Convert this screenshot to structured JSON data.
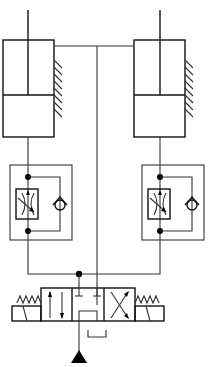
{
  "diagram": {
    "type": "hydraulic-schematic",
    "colors": {
      "line": "#111111",
      "background": "#ffffff"
    },
    "components": [
      {
        "id": "cylinder-left",
        "kind": "double-acting-cylinder"
      },
      {
        "id": "cylinder-right",
        "kind": "double-acting-cylinder"
      },
      {
        "id": "flow-control-left",
        "kind": "one-way-flow-control-valve",
        "parts": [
          "adjustable-throttle",
          "check-valve"
        ]
      },
      {
        "id": "flow-control-right",
        "kind": "one-way-flow-control-valve",
        "parts": [
          "adjustable-throttle",
          "check-valve"
        ]
      },
      {
        "id": "directional-valve",
        "kind": "4/3-directional-valve",
        "actuation": [
          "solenoid-left",
          "solenoid-right"
        ],
        "return": "spring-centered"
      },
      {
        "id": "pump-source",
        "kind": "pressure-source"
      },
      {
        "id": "tank",
        "kind": "reservoir"
      }
    ],
    "labels": []
  }
}
